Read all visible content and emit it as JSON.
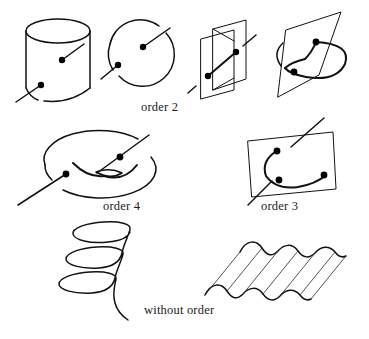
{
  "page": {
    "background_color": "#ffffff",
    "ink_color": "#111111",
    "width": 369,
    "height": 339
  },
  "captions": {
    "order_2": "order 2",
    "order_4": "order 4",
    "order_3": "order 3",
    "without_order": "without order"
  },
  "figures": {
    "row1": [
      {
        "id": "cylinder",
        "name": "cylinder-with-two-axes",
        "order": "order 2"
      },
      {
        "id": "disk",
        "name": "circle-with-two-axes",
        "order": "order 2"
      },
      {
        "id": "crossed-planes",
        "name": "two-crossing-planes-with-axis",
        "order": "order 2"
      },
      {
        "id": "plane-and-circle",
        "name": "plane-pierced-by-circle",
        "order": "order 2"
      }
    ],
    "row2": [
      {
        "id": "disk-with-curve",
        "name": "disk-with-interior-curve",
        "order": "order 4"
      },
      {
        "id": "plane-with-curve",
        "name": "plane-with-curve-and-axes",
        "order": "order 3"
      }
    ],
    "row3": [
      {
        "id": "helix",
        "name": "helix-coil",
        "order": "without order"
      },
      {
        "id": "corrugated-surface",
        "name": "corrugated-wave-surface",
        "order": "without order"
      }
    ]
  }
}
